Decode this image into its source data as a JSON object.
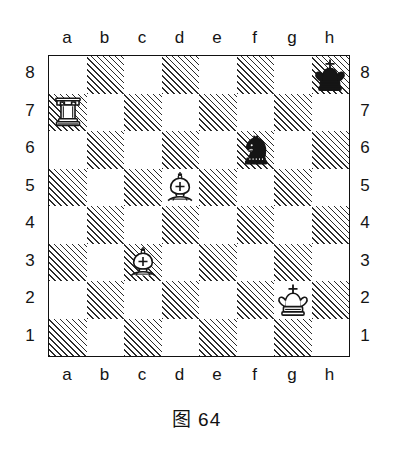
{
  "figure": {
    "caption": "图 64",
    "caption_number": "64"
  },
  "board": {
    "files": [
      "a",
      "b",
      "c",
      "d",
      "e",
      "f",
      "g",
      "h"
    ],
    "ranks": [
      "8",
      "7",
      "6",
      "5",
      "4",
      "3",
      "2",
      "1"
    ],
    "light_square_color": "#ffffff",
    "dark_square_style": "diagonal-hatch",
    "dark_square_color": "#2b2b2b",
    "border_color": "#111111",
    "orientation": "white-bottom",
    "size": 8,
    "file_labels_top": [
      "a",
      "b",
      "c",
      "d",
      "e",
      "f",
      "g",
      "h"
    ],
    "file_labels_bottom": [
      "a",
      "b",
      "c",
      "d",
      "e",
      "f",
      "g",
      "h"
    ],
    "rank_labels_left": [
      "8",
      "7",
      "6",
      "5",
      "4",
      "3",
      "2",
      "1"
    ],
    "rank_labels_right": [
      "8",
      "7",
      "6",
      "5",
      "4",
      "3",
      "2",
      "1"
    ]
  },
  "pieces": [
    {
      "square": "h8",
      "file": "h",
      "rank": "8",
      "color": "black",
      "type": "king",
      "name": "black-king",
      "symbol": "♚"
    },
    {
      "square": "a7",
      "file": "a",
      "rank": "7",
      "color": "white",
      "type": "rook",
      "name": "white-rook",
      "symbol": "♖"
    },
    {
      "square": "f6",
      "file": "f",
      "rank": "6",
      "color": "black",
      "type": "knight",
      "name": "black-knight",
      "symbol": "♞"
    },
    {
      "square": "d5",
      "file": "d",
      "rank": "5",
      "color": "white",
      "type": "bishop",
      "name": "white-bishop",
      "symbol": "♗"
    },
    {
      "square": "c3",
      "file": "c",
      "rank": "3",
      "color": "white",
      "type": "bishop",
      "name": "white-bishop",
      "symbol": "♗"
    },
    {
      "square": "g2",
      "file": "g",
      "rank": "2",
      "color": "white",
      "type": "king",
      "name": "white-king",
      "symbol": "♔"
    }
  ],
  "position": {
    "white": [
      "Ra7",
      "Bd5",
      "Bc3",
      "Kg2"
    ],
    "black": [
      "Kh8",
      "Nf6"
    ]
  }
}
